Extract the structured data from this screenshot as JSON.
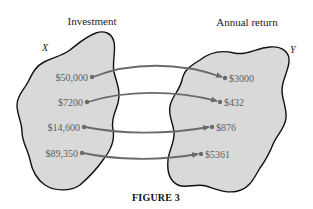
{
  "figure": {
    "caption": "FIGURE 3",
    "colors": {
      "blob_fill": "#d9d9d9",
      "blob_stroke": "#111111",
      "arrow": "#6a6a6a",
      "dot": "#6a6a6a",
      "value_text": "#5e5e5e"
    }
  },
  "domain_set": {
    "title": "Investment",
    "variable": "X",
    "elements": [
      "$50,000",
      "$7200",
      "$14,600",
      "$89,350"
    ]
  },
  "codomain_set": {
    "title": "Annual return",
    "variable": "Y",
    "elements": [
      "$3000",
      "$432",
      "$876",
      "$5361"
    ]
  },
  "mapping": [
    {
      "from": "$50,000",
      "to": "$3000"
    },
    {
      "from": "$7200",
      "to": "$432"
    },
    {
      "from": "$14,600",
      "to": "$876"
    },
    {
      "from": "$89,350",
      "to": "$5361"
    }
  ]
}
